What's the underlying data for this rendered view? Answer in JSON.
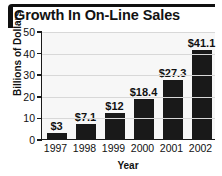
{
  "chart_data": {
    "type": "bar",
    "title": "Growth In On-Line Sales",
    "xlabel": "Year",
    "ylabel": "Billions of Dollars",
    "categories": [
      "1997",
      "1998",
      "1999",
      "2000",
      "2001",
      "2002"
    ],
    "values": [
      3,
      7.1,
      12,
      18.4,
      27.3,
      41.1
    ],
    "value_labels": [
      "$3",
      "$7.1",
      "$12",
      "$18.4",
      "$27.3",
      "$41.1"
    ],
    "ylim": [
      0,
      50
    ],
    "yticks": [
      0,
      10,
      20,
      30,
      40,
      50
    ],
    "ytick_labels": [
      "0",
      "10",
      "20",
      "30",
      "40",
      "50"
    ],
    "grid": true,
    "legend": "none",
    "colors": {
      "bar": "#191919",
      "plot_background": "#f7f7f7",
      "gridline": "#d8d8d8",
      "axis": "#1a1a1a",
      "text": "#111111",
      "title_rule": "#101010"
    }
  }
}
